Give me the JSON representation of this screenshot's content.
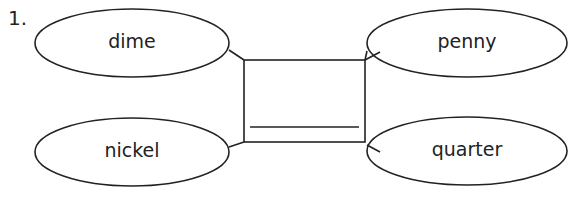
{
  "problem": {
    "number": "1."
  },
  "diagram": {
    "ellipses": [
      {
        "id": "dime",
        "label": "dime",
        "cx": 132,
        "cy": 43,
        "rx": 97,
        "ry": 34
      },
      {
        "id": "penny",
        "label": "penny",
        "cx": 467,
        "cy": 43,
        "rx": 100,
        "ry": 34
      },
      {
        "id": "nickel",
        "label": "nickel",
        "cx": 132,
        "cy": 152,
        "rx": 97,
        "ry": 34
      },
      {
        "id": "quarter",
        "label": "quarter",
        "cx": 467,
        "cy": 151,
        "rx": 100,
        "ry": 34
      }
    ],
    "center_box": {
      "x": 244,
      "y": 60,
      "width": 121,
      "height": 82,
      "answer_line_y": 127,
      "answer": ""
    },
    "stroke_color": "#222222"
  }
}
